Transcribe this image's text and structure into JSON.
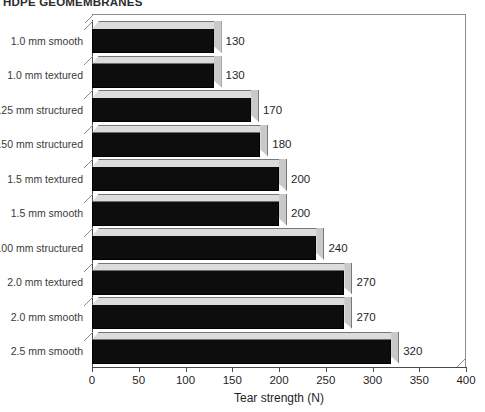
{
  "chart_data": {
    "type": "bar",
    "orientation": "horizontal",
    "style": "3d",
    "title": "HDPE GEOMEMBRANES",
    "xlabel": "Tear strength (N)",
    "ylabel": "",
    "categories": [
      "1.0 mm smooth",
      "1.0 mm textured",
      "1.25 mm structured",
      "1.50 mm structured",
      "1.5 mm textured",
      "1.5 mm smooth",
      "2.00 mm structured",
      "2.0 mm textured",
      "2.0 mm smooth",
      "2.5 mm smooth"
    ],
    "values": [
      130,
      130,
      170,
      180,
      200,
      200,
      240,
      270,
      270,
      320
    ],
    "value_labels": [
      "130",
      "130",
      "170",
      "180",
      "200",
      "200",
      "240",
      "270",
      "270",
      "320"
    ],
    "xlim": [
      0,
      400
    ],
    "xticks": [
      0,
      50,
      100,
      150,
      200,
      250,
      300,
      350,
      400
    ],
    "xtick_labels": [
      "0",
      "50",
      "100",
      "150",
      "200",
      "250",
      "300",
      "350",
      "400"
    ],
    "grid": false,
    "legend": false,
    "bar_color": "#0d0d0d",
    "bar_top_color": "#dcdcdc",
    "bar_side_color": "#c9c9c9",
    "axis_color": "#4a4a4a",
    "frame_color": "#8c8c8c",
    "background": "#ffffff"
  }
}
